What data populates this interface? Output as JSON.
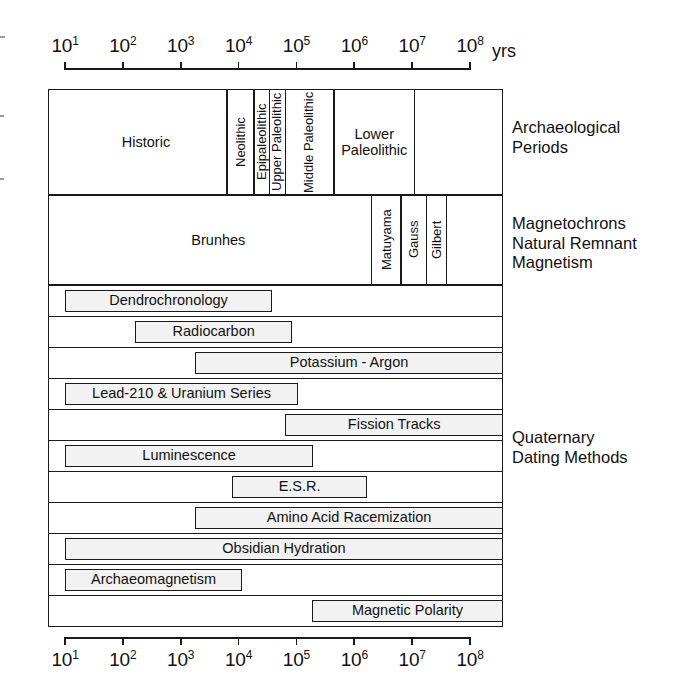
{
  "figure": {
    "axis_unit": "yrs",
    "axis_ticks": [
      "10¹",
      "10²",
      "10³",
      "10⁴",
      "10⁵",
      "10⁶",
      "10⁷",
      "10⁸"
    ],
    "axis_exponents": [
      1,
      2,
      3,
      4,
      5,
      6,
      7,
      8
    ],
    "axis_base": "10"
  },
  "side_labels": {
    "archaeological": "Archaeological\nPeriods",
    "magnetochrons": "Magnetochrons\nNatural Remnant\nMagnetism",
    "quaternary": "Quaternary\nDating Methods"
  },
  "chart_data": {
    "type": "bar",
    "title": "Quaternary Dating Methods",
    "xlabel": "yrs",
    "ylabel": "",
    "xscale": "log10",
    "xlim": [
      1,
      8
    ],
    "grid": false,
    "legend": "none",
    "axis_tick_labels": [
      "10^1",
      "10^2",
      "10^3",
      "10^4",
      "10^5",
      "10^6",
      "10^7",
      "10^8"
    ],
    "rows": [
      {
        "group": "Archaeological Periods",
        "orientation": "horizontal-band",
        "cells": [
          {
            "label": "Historic",
            "start_exp": 1.0,
            "end_exp": 3.8,
            "orient": "horizontal"
          },
          {
            "label": "Neolithic",
            "start_exp": 3.8,
            "end_exp": 4.27,
            "orient": "vertical"
          },
          {
            "label": "Epipaleolithic",
            "start_exp": 4.27,
            "end_exp": 4.53,
            "orient": "vertical"
          },
          {
            "label": "Upper Paleolithic",
            "start_exp": 4.53,
            "end_exp": 4.81,
            "orient": "vertical"
          },
          {
            "label": "Middle\nPaleolithic",
            "start_exp": 4.81,
            "end_exp": 5.65,
            "orient": "vertical"
          },
          {
            "label": "Lower\nPaleolithic",
            "start_exp": 5.65,
            "end_exp": 7.04,
            "orient": "horizontal"
          },
          {
            "label": "",
            "start_exp": 7.04,
            "end_exp": 8.86,
            "orient": "horizontal"
          }
        ]
      },
      {
        "group": "Magnetochrons Natural Remnant Magnetism",
        "orientation": "horizontal-band",
        "cells": [
          {
            "label": "Brunhes",
            "start_exp": 1.0,
            "end_exp": 6.3,
            "orient": "horizontal"
          },
          {
            "label": "Matuyama",
            "start_exp": 6.3,
            "end_exp": 6.81,
            "orient": "vertical"
          },
          {
            "label": "Gauss",
            "start_exp": 6.81,
            "end_exp": 7.25,
            "orient": "vertical"
          },
          {
            "label": "Gilbert",
            "start_exp": 7.25,
            "end_exp": 7.59,
            "orient": "vertical"
          },
          {
            "label": "",
            "start_exp": 7.59,
            "end_exp": 8.86,
            "orient": "horizontal"
          }
        ]
      }
    ],
    "methods": [
      {
        "label": "Dendrochronology",
        "start_exp": 1.0,
        "end_exp": 4.58
      },
      {
        "label": "Radiocarbon",
        "start_exp": 2.21,
        "end_exp": 4.93
      },
      {
        "label": "Potassium - Argon",
        "start_exp": 3.25,
        "end_exp": 8.86
      },
      {
        "label": "Lead-210 & Uranium Series",
        "start_exp": 1.0,
        "end_exp": 5.03
      },
      {
        "label": "Fission Tracks",
        "start_exp": 4.81,
        "end_exp": 8.86
      },
      {
        "label": "Luminescence",
        "start_exp": 1.0,
        "end_exp": 5.29
      },
      {
        "label": "E.S.R.",
        "start_exp": 3.89,
        "end_exp": 6.22
      },
      {
        "label": "Amino Acid Racemization",
        "start_exp": 3.25,
        "end_exp": 8.86
      },
      {
        "label": "Obsidian Hydration",
        "start_exp": 1.0,
        "end_exp": 8.86
      },
      {
        "label": "Archaeomagnetism",
        "start_exp": 1.0,
        "end_exp": 4.06
      },
      {
        "label": "Magnetic Polarity",
        "start_exp": 5.27,
        "end_exp": 8.86
      }
    ]
  }
}
